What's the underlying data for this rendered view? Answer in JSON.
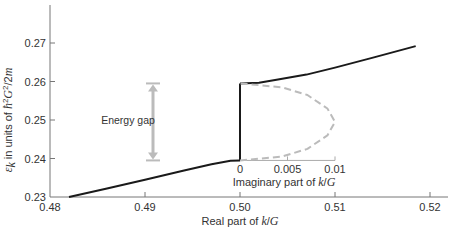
{
  "chart_data": {
    "type": "line",
    "title": "",
    "xlabel": "Real part of k/G",
    "xlabel_parts": [
      "Real part of ",
      "k",
      "/",
      "G"
    ],
    "ylabel": "ε_k in units of ħ²G²/2m",
    "xlim": [
      0.48,
      0.52
    ],
    "ylim": [
      0.23,
      0.28
    ],
    "x_ticks": [
      0.48,
      0.49,
      0.5,
      0.51,
      0.52
    ],
    "x_tick_labels": [
      "0.48",
      "0.49",
      "0.50",
      "0.51",
      "0.52"
    ],
    "y_ticks": [
      0.23,
      0.24,
      0.25,
      0.26,
      0.27
    ],
    "y_tick_labels": [
      "0.23",
      "0.24",
      "0.25",
      "0.26",
      "0.27"
    ],
    "grid": false,
    "series": [
      {
        "name": "lower band (real k)",
        "style": "solid",
        "color": "#1a1a1a",
        "points": [
          [
            0.482,
            0.23
          ],
          [
            0.486,
            0.2322
          ],
          [
            0.49,
            0.2345
          ],
          [
            0.494,
            0.2368
          ],
          [
            0.497,
            0.2385
          ],
          [
            0.499,
            0.2394
          ],
          [
            0.5,
            0.2395
          ]
        ]
      },
      {
        "name": "band gap edge (vertical)",
        "style": "solid",
        "color": "#1a1a1a",
        "points": [
          [
            0.5,
            0.2395
          ],
          [
            0.5,
            0.2595
          ]
        ]
      },
      {
        "name": "upper band (real k)",
        "style": "solid",
        "color": "#1a1a1a",
        "points": [
          [
            0.5,
            0.2595
          ],
          [
            0.502,
            0.2597
          ],
          [
            0.504,
            0.2605
          ],
          [
            0.507,
            0.2618
          ],
          [
            0.51,
            0.2636
          ],
          [
            0.514,
            0.2662
          ],
          [
            0.5185,
            0.2692
          ]
        ]
      }
    ],
    "inset": {
      "xlabel": "Imaginary part of k/G",
      "xlabel_parts": [
        "Imaginary part of ",
        "k",
        "/",
        "G"
      ],
      "xlim": [
        0,
        0.01
      ],
      "x_ticks": [
        0,
        0.005,
        0.01
      ],
      "x_tick_labels": [
        "0",
        "0.005",
        "0.01"
      ],
      "series": [
        {
          "name": "complex k within gap",
          "style": "dashed",
          "color": "#bbbbbb",
          "points": [
            [
              0,
              0.2395
            ],
            [
              0.0044,
              0.2405
            ],
            [
              0.0071,
              0.2425
            ],
            [
              0.0092,
              0.246
            ],
            [
              0.01,
              0.2495
            ],
            [
              0.0092,
              0.253
            ],
            [
              0.0071,
              0.2565
            ],
            [
              0.0044,
              0.2585
            ],
            [
              0,
              0.2595
            ]
          ]
        }
      ]
    },
    "annotations": [
      {
        "text": "Energy gap",
        "arrow_from": 0.2395,
        "arrow_to": 0.2595,
        "type": "double-arrow",
        "color": "#bbbbbb"
      }
    ]
  }
}
